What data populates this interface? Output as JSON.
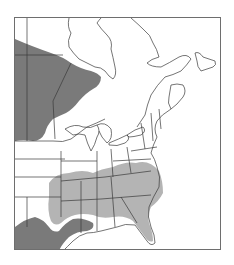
{
  "map": {
    "type": "range-map",
    "region": "Eastern North America (eastern Canada and eastern United States)",
    "legend": [
      {
        "name": "range-dark",
        "color": "#7a7a7a"
      },
      {
        "name": "range-light",
        "color": "#b4b4b4"
      }
    ],
    "colors": {
      "background": "#ffffff",
      "land": "#ffffff",
      "borders": "#3a3a3a",
      "frame": "#6e6e6e",
      "range_dark": "#7a7a7a",
      "range_light": "#b4b4b4"
    },
    "labels": []
  }
}
